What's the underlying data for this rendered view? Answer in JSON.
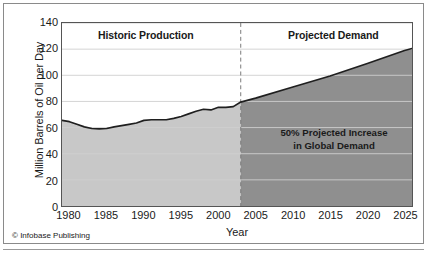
{
  "figure": {
    "credit_mark": "©",
    "credit_text": "Infobase Publishing"
  },
  "chart_data": {
    "type": "area",
    "title": "",
    "xlabel": "Year",
    "ylabel": "Million Barrels of Oil per Day",
    "xlim": [
      1979,
      2026
    ],
    "ylim": [
      0,
      140
    ],
    "grid": true,
    "legend": "none",
    "x_ticks": [
      1980,
      1985,
      1990,
      1995,
      2000,
      2005,
      2010,
      2015,
      2020,
      2025
    ],
    "x_tick_labels": [
      "1980",
      "1985",
      "1990",
      "1995",
      "2000",
      "2005",
      "2010",
      "2015",
      "2020",
      "2025"
    ],
    "y_ticks": [
      0,
      20,
      40,
      60,
      80,
      100,
      120,
      140
    ],
    "y_tick_labels": [
      "0",
      "20",
      "40",
      "60",
      "80",
      "100",
      "120",
      "140"
    ],
    "divider_x": 2003,
    "bands": [
      {
        "name": "historic",
        "label": "Historic Production",
        "x_start": 1979,
        "x_end": 2003,
        "fill": "#c8c8c8"
      },
      {
        "name": "projected",
        "label": "Projected Demand",
        "x_start": 2003,
        "x_end": 2026,
        "fill": "#8f8f8f"
      }
    ],
    "annotation": {
      "line1": "50% Projected Increase",
      "line2": "in Global Demand"
    },
    "series": [
      {
        "name": "Oil production and projected demand",
        "x": [
          1979,
          1980,
          1981,
          1982,
          1983,
          1984,
          1985,
          1986,
          1987,
          1988,
          1989,
          1990,
          1991,
          1992,
          1993,
          1994,
          1995,
          1996,
          1997,
          1998,
          1999,
          2000,
          2001,
          2002,
          2003,
          2005,
          2010,
          2015,
          2020,
          2025,
          2026
        ],
        "values": [
          65.5,
          64.5,
          62.5,
          60.5,
          59.3,
          59.0,
          59.3,
          60.5,
          61.5,
          62.5,
          63.5,
          65.5,
          66.0,
          66.0,
          66.0,
          67.0,
          68.5,
          70.5,
          72.5,
          74.0,
          73.5,
          75.5,
          75.5,
          76.0,
          79.5,
          82.5,
          91.0,
          99.5,
          109.0,
          119.0,
          120.5
        ]
      }
    ]
  }
}
